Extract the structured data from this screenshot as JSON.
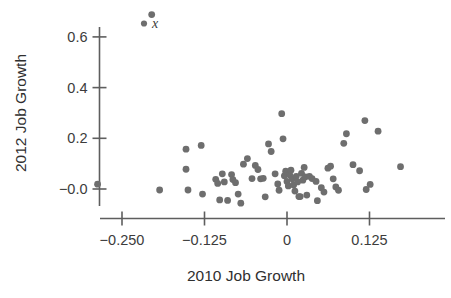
{
  "chart_data": {
    "type": "scatter",
    "title": "",
    "xlabel": "2010 Job Growth",
    "ylabel": "2012 Job Growth",
    "xlim": [
      -0.315,
      0.205
    ],
    "ylim": [
      -0.085,
      0.72
    ],
    "grid": false,
    "legend_position": "top-left-inside",
    "series": [
      {
        "name": "x",
        "marker": "filled-circle",
        "color": "#6e6e6e",
        "points": [
          [
            -0.287,
            0.019
          ],
          [
            -0.205,
            0.688
          ],
          [
            -0.193,
            -0.004
          ],
          [
            -0.153,
            0.157
          ],
          [
            -0.153,
            0.078
          ],
          [
            -0.15,
            -0.004
          ],
          [
            -0.13,
            0.172
          ],
          [
            -0.128,
            -0.02
          ],
          [
            -0.108,
            0.038
          ],
          [
            -0.105,
            0.022
          ],
          [
            -0.102,
            -0.043
          ],
          [
            -0.098,
            0.06
          ],
          [
            -0.095,
            0.028
          ],
          [
            -0.09,
            -0.045
          ],
          [
            -0.084,
            0.057
          ],
          [
            -0.082,
            0.037
          ],
          [
            -0.078,
            0.025
          ],
          [
            -0.074,
            -0.02
          ],
          [
            -0.07,
            -0.056
          ],
          [
            -0.066,
            0.098
          ],
          [
            -0.06,
            0.12
          ],
          [
            -0.053,
            0.041
          ],
          [
            -0.048,
            0.093
          ],
          [
            -0.044,
            0.077
          ],
          [
            -0.04,
            0.04
          ],
          [
            -0.036,
            0.042
          ],
          [
            -0.033,
            -0.031
          ],
          [
            -0.028,
            0.178
          ],
          [
            -0.024,
            0.148
          ],
          [
            -0.018,
            0.06
          ],
          [
            -0.014,
            0.02
          ],
          [
            -0.012,
            -0.005
          ],
          [
            -0.008,
            0.297
          ],
          [
            -0.006,
            0.198
          ],
          [
            -0.004,
            0.052
          ],
          [
            -0.002,
            0.07
          ],
          [
            0.0,
            0.03
          ],
          [
            0.002,
            0.012
          ],
          [
            0.004,
            0.056
          ],
          [
            0.006,
            0.074
          ],
          [
            0.008,
            0.04
          ],
          [
            0.01,
            0.016
          ],
          [
            0.012,
            -0.008
          ],
          [
            0.014,
            0.05
          ],
          [
            0.016,
            0.028
          ],
          [
            0.018,
            -0.03
          ],
          [
            0.02,
            -0.03
          ],
          [
            0.022,
            0.062
          ],
          [
            0.024,
            0.035
          ],
          [
            0.026,
            0.085
          ],
          [
            0.028,
            0.048
          ],
          [
            0.03,
            -0.024
          ],
          [
            0.034,
            0.05
          ],
          [
            0.038,
            0.041
          ],
          [
            0.044,
            0.03
          ],
          [
            0.046,
            -0.046
          ],
          [
            0.052,
            0.005
          ],
          [
            0.056,
            -0.012
          ],
          [
            0.062,
            0.082
          ],
          [
            0.066,
            0.09
          ],
          [
            0.07,
            0.04
          ],
          [
            0.074,
            0.008
          ],
          [
            0.078,
            -0.005
          ],
          [
            0.086,
            0.18
          ],
          [
            0.09,
            0.218
          ],
          [
            0.1,
            0.096
          ],
          [
            0.11,
            0.072
          ],
          [
            0.118,
            0.27
          ],
          [
            0.12,
            -0.002
          ],
          [
            0.126,
            0.018
          ],
          [
            0.138,
            0.228
          ],
          [
            0.172,
            0.088
          ]
        ]
      }
    ],
    "xticks": [
      {
        "value": -0.25,
        "label": "−0.250"
      },
      {
        "value": -0.125,
        "label": "−0.125"
      },
      {
        "value": 0,
        "label": "0"
      },
      {
        "value": 0.125,
        "label": "0.125"
      }
    ],
    "yticks": [
      {
        "value": 0.6,
        "label": "0.6"
      },
      {
        "value": 0.4,
        "label": "0.4"
      },
      {
        "value": 0.2,
        "label": "0.2"
      },
      {
        "value": 0.0,
        "label": "−0.0"
      }
    ],
    "legend": [
      {
        "label": "x",
        "marker": "filled-circle",
        "color": "#6e6e6e"
      }
    ]
  },
  "colors": {
    "marker": "#6e6e6e",
    "axis": "#5e5e5e",
    "text": "#3c3c3c",
    "background": "#ffffff"
  }
}
